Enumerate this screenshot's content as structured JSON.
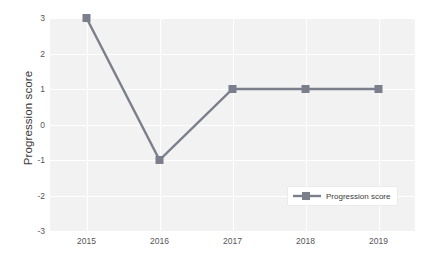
{
  "chart_data": {
    "type": "line",
    "title": "",
    "xlabel": "",
    "ylabel": "Progression score",
    "categories": [
      "2015",
      "2016",
      "2017",
      "2018",
      "2019"
    ],
    "series": [
      {
        "name": "Progression score",
        "values": [
          3,
          -1,
          1,
          1,
          1
        ],
        "color": "#7b7f8c",
        "marker": "square"
      }
    ],
    "ylim": [
      -3,
      3
    ],
    "yticks": [
      "3",
      "2",
      "1",
      "0",
      "-1",
      "-2",
      "-3"
    ],
    "ytick_values": [
      3,
      2,
      1,
      0,
      -1,
      -2,
      -3
    ],
    "grid": true,
    "grid_color": "#ffffff",
    "plot_background": "#f2f2f2",
    "legend_position": "lower right"
  },
  "legend": {
    "entries": [
      {
        "label": "Progression score",
        "color": "#7b7f8c"
      }
    ]
  },
  "caption": {
    "bottom_cropped_text": "",
    "top_cropped_text": ""
  }
}
